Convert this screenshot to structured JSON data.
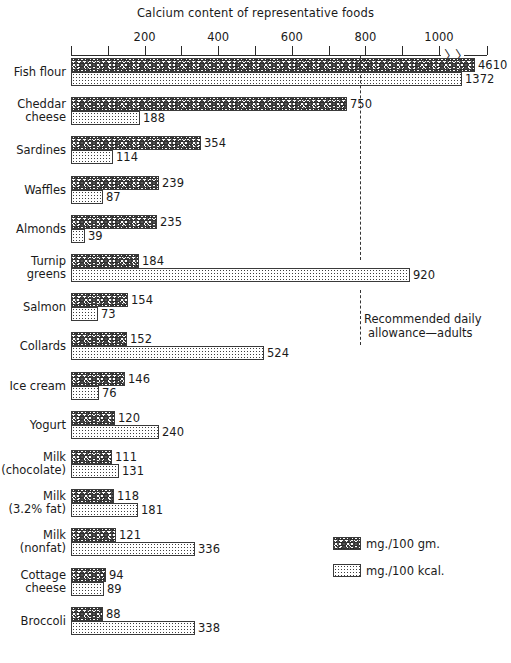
{
  "chart_data": {
    "type": "bar",
    "orientation": "horizontal",
    "title": "Calcium content of representative foods",
    "xlabel": "",
    "ylabel": "",
    "xlim": [
      0,
      1100
    ],
    "grid": false,
    "axis_break": true,
    "axis_break_note": "axis broken after 1000; Fish flour bars exceed scale",
    "tick_values": [
      0,
      100,
      200,
      300,
      400,
      500,
      600,
      700,
      800,
      900,
      1000
    ],
    "tick_labels": [
      "",
      "",
      "200",
      "",
      "400",
      "",
      "600",
      "",
      "800",
      "",
      "1000"
    ],
    "legend_position": "middle-right",
    "series": [
      {
        "name": "mg./100 gm.",
        "key": "gm"
      },
      {
        "name": "mg./100 kcal.",
        "key": "kcal"
      }
    ],
    "categories": [
      "Fish flour",
      "Cheddar cheese",
      "Sardines",
      "Waffles",
      "Almonds",
      "Turnip greens",
      "Salmon",
      "Collards",
      "Ice cream",
      "Yogurt",
      "Milk (chocolate)",
      "Milk (3.2% fat)",
      "Milk (nonfat)",
      "Cottage cheese",
      "Broccoli"
    ],
    "values_gm": [
      4610,
      750,
      354,
      239,
      235,
      184,
      154,
      152,
      146,
      120,
      111,
      118,
      121,
      94,
      88
    ],
    "values_kcal": [
      1372,
      188,
      114,
      87,
      39,
      920,
      73,
      524,
      76,
      240,
      131,
      181,
      336,
      89,
      338
    ],
    "annotations": [
      {
        "name": "recommended-daily-allowance",
        "value": 800,
        "text_line1": "Recommended daily",
        "text_line2": "allowance—adults",
        "style": "vertical dashed line"
      }
    ]
  },
  "rows": [
    {
      "label_line1": "Fish flour",
      "label_line2": "",
      "gm": "4610",
      "kcal": "1372",
      "gm_w": 404,
      "kcal_w": 391,
      "gm_clip": true,
      "kcal_clip": true
    },
    {
      "label_line1": "Cheddar",
      "label_line2": "cheese",
      "gm": "750",
      "kcal": "188",
      "gm_w": 276,
      "kcal_w": 69,
      "gm_clip": false,
      "kcal_clip": false
    },
    {
      "label_line1": "Sardines",
      "label_line2": "",
      "gm": "354",
      "kcal": "114",
      "gm_w": 130,
      "kcal_w": 42,
      "gm_clip": false,
      "kcal_clip": false
    },
    {
      "label_line1": "Waffles",
      "label_line2": "",
      "gm": "239",
      "kcal": "87",
      "gm_w": 88,
      "kcal_w": 32,
      "gm_clip": false,
      "kcal_clip": false
    },
    {
      "label_line1": "Almonds",
      "label_line2": "",
      "gm": "235",
      "kcal": "39",
      "gm_w": 86,
      "kcal_w": 14,
      "gm_clip": false,
      "kcal_clip": false
    },
    {
      "label_line1": "Turnip",
      "label_line2": "greens",
      "gm": "184",
      "kcal": "920",
      "gm_w": 68,
      "kcal_w": 339,
      "gm_clip": false,
      "kcal_clip": false
    },
    {
      "label_line1": "Salmon",
      "label_line2": "",
      "gm": "154",
      "kcal": "73",
      "gm_w": 57,
      "kcal_w": 27,
      "gm_clip": false,
      "kcal_clip": false
    },
    {
      "label_line1": "Collards",
      "label_line2": "",
      "gm": "152",
      "kcal": "524",
      "gm_w": 56,
      "kcal_w": 193,
      "gm_clip": false,
      "kcal_clip": false
    },
    {
      "label_line1": "Ice cream",
      "label_line2": "",
      "gm": "146",
      "kcal": "76",
      "gm_w": 54,
      "kcal_w": 28,
      "gm_clip": false,
      "kcal_clip": false
    },
    {
      "label_line1": "Yogurt",
      "label_line2": "",
      "gm": "120",
      "kcal": "240",
      "gm_w": 44,
      "kcal_w": 88,
      "gm_clip": false,
      "kcal_clip": false
    },
    {
      "label_line1": "Milk",
      "label_line2": "(chocolate)",
      "gm": "111",
      "kcal": "131",
      "gm_w": 41,
      "kcal_w": 48,
      "gm_clip": false,
      "kcal_clip": false
    },
    {
      "label_line1": "Milk",
      "label_line2": "(3.2% fat)",
      "gm": "118",
      "kcal": "181",
      "gm_w": 43,
      "kcal_w": 67,
      "gm_clip": false,
      "kcal_clip": false
    },
    {
      "label_line1": "Milk",
      "label_line2": "(nonfat)",
      "gm": "121",
      "kcal": "336",
      "gm_w": 45,
      "kcal_w": 124,
      "gm_clip": false,
      "kcal_clip": false
    },
    {
      "label_line1": "Cottage",
      "label_line2": "cheese",
      "gm": "94",
      "kcal": "89",
      "gm_w": 35,
      "kcal_w": 33,
      "gm_clip": false,
      "kcal_clip": false
    },
    {
      "label_line1": "Broccoli",
      "label_line2": "",
      "gm": "88",
      "kcal": "338",
      "gm_w": 32,
      "kcal_w": 124,
      "gm_clip": false,
      "kcal_clip": false
    }
  ],
  "axis": {
    "labels": [
      {
        "text": "200",
        "value": 200
      },
      {
        "text": "400",
        "value": 400
      },
      {
        "text": "600",
        "value": 600
      },
      {
        "text": "800",
        "value": 800
      },
      {
        "text": "1000",
        "value": 1000
      }
    ],
    "break_glyph": "⸺"
  },
  "rda": {
    "line1": "Recommended daily",
    "line2": "allowance—adults"
  },
  "legend": [
    {
      "label": "mg./100 gm.",
      "texture": "coarse-speckle"
    },
    {
      "label": "mg./100 kcal.",
      "texture": "fine-dots"
    }
  ]
}
